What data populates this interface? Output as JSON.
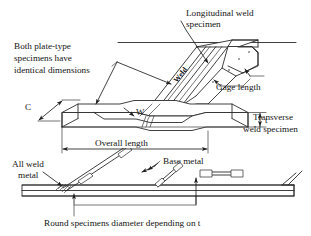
{
  "figure": {
    "background_color": "#ffffff",
    "line_color": "#2b2b2b",
    "text_color": "#141414"
  },
  "labels": {
    "longitudinal_line1": "Longitudinal weld",
    "longitudinal_line2": "specimen",
    "both_plate_line1": "Both plate-type",
    "both_plate_line2": "specimens have",
    "both_plate_line3": "identical dimensions",
    "gage_length": "Gage length",
    "transverse_line1": "Transverse",
    "transverse_line2": "weld specimen",
    "overall_length": "Overall length",
    "all_weld_line1": "All weld",
    "all_weld_line2": "metal",
    "base_metal": "Base metal",
    "round_specimens": "Round specimens diameter depending on t",
    "weld_on_specimen": "Weld"
  },
  "dimensions": {
    "width_c": "C",
    "width_w": "W",
    "thickness_t": "t"
  }
}
